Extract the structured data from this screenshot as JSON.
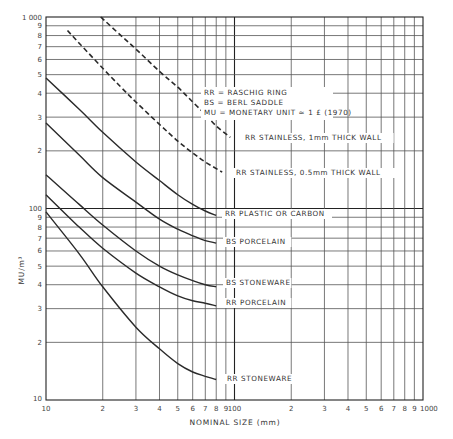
{
  "chart_data": {
    "type": "line",
    "title": "",
    "xlabel": "NOMINAL SIZE (mm)",
    "ylabel": "MU/m³",
    "xscale": "log",
    "yscale": "log",
    "xlim": [
      10,
      1000
    ],
    "ylim": [
      10,
      1000
    ],
    "grid": true,
    "x_tick_labels": [
      {
        "v": 10,
        "t": "10"
      },
      {
        "v": 20,
        "t": "2"
      },
      {
        "v": 30,
        "t": "3"
      },
      {
        "v": 40,
        "t": "4"
      },
      {
        "v": 50,
        "t": "5"
      },
      {
        "v": 60,
        "t": "6"
      },
      {
        "v": 70,
        "t": "7"
      },
      {
        "v": 80,
        "t": "8"
      },
      {
        "v": 90,
        "t": "9"
      },
      {
        "v": 100,
        "t": "100"
      },
      {
        "v": 200,
        "t": "2"
      },
      {
        "v": 300,
        "t": "3"
      },
      {
        "v": 400,
        "t": "4"
      },
      {
        "v": 500,
        "t": "5"
      },
      {
        "v": 600,
        "t": "6"
      },
      {
        "v": 700,
        "t": "7"
      },
      {
        "v": 800,
        "t": "8"
      },
      {
        "v": 900,
        "t": "9"
      },
      {
        "v": 1000,
        "t": "1000"
      }
    ],
    "y_tick_labels": [
      {
        "v": 10,
        "t": "10"
      },
      {
        "v": 20,
        "t": "2"
      },
      {
        "v": 30,
        "t": "3"
      },
      {
        "v": 40,
        "t": "4"
      },
      {
        "v": 50,
        "t": "5"
      },
      {
        "v": 60,
        "t": "6"
      },
      {
        "v": 70,
        "t": "7"
      },
      {
        "v": 80,
        "t": "8"
      },
      {
        "v": 90,
        "t": "9"
      },
      {
        "v": 100,
        "t": "100"
      },
      {
        "v": 200,
        "t": "2"
      },
      {
        "v": 300,
        "t": "3"
      },
      {
        "v": 400,
        "t": "4"
      },
      {
        "v": 500,
        "t": "5"
      },
      {
        "v": 600,
        "t": "6"
      },
      {
        "v": 700,
        "t": "7"
      },
      {
        "v": 800,
        "t": "8"
      },
      {
        "v": 900,
        "t": "9"
      },
      {
        "v": 1000,
        "t": "1 000"
      }
    ],
    "legend_notes": [
      "RR = RASCHIG RING",
      "BS = BERL SADDLE",
      "MU = MONETARY UNIT ≈ 1 £ (1970)"
    ],
    "series": [
      {
        "name": "RR STAINLESS, 1mm THICK WALL",
        "style": "dashed",
        "x": [
          19.5,
          25,
          30,
          40,
          50,
          60,
          70,
          80,
          95
        ],
        "y": [
          1000,
          800,
          680,
          520,
          430,
          360,
          310,
          270,
          235
        ],
        "label_at": [
          245,
          140
        ]
      },
      {
        "name": "RR STAINLESS, 0.5mm THICK WALL",
        "style": "dashed",
        "x": [
          13,
          15,
          20,
          25,
          30,
          40,
          50,
          60,
          70,
          86
        ],
        "y": [
          850,
          730,
          540,
          430,
          360,
          275,
          225,
          195,
          175,
          155
        ],
        "label_at": [
          236,
          175
        ]
      },
      {
        "name": "RR PLASTIC OR CARBON",
        "style": "solid",
        "x": [
          10,
          15,
          20,
          30,
          40,
          50,
          60,
          70,
          80
        ],
        "y": [
          480,
          330,
          250,
          175,
          140,
          118,
          105,
          97,
          92
        ],
        "label_at": [
          225,
          216
        ]
      },
      {
        "name": "BS PORCELAIN",
        "style": "solid",
        "x": [
          10,
          15,
          20,
          30,
          40,
          50,
          60,
          70,
          80
        ],
        "y": [
          280,
          190,
          145,
          108,
          88,
          78,
          72,
          68,
          66
        ],
        "label_at": [
          226,
          244
        ]
      },
      {
        "name": "BS STONEWARE",
        "style": "solid",
        "x": [
          10,
          15,
          20,
          30,
          40,
          50,
          60,
          70,
          80
        ],
        "y": [
          150,
          105,
          82,
          60,
          50,
          45,
          42,
          40,
          39
        ],
        "label_at": [
          226,
          285
        ]
      },
      {
        "name": "RR PORCELAIN",
        "style": "solid",
        "x": [
          10,
          15,
          20,
          30,
          40,
          50,
          60,
          70,
          80
        ],
        "y": [
          118,
          80,
          62,
          46,
          39,
          35,
          33,
          32,
          31
        ],
        "label_at": [
          226,
          305
        ]
      },
      {
        "name": "RR STONEWARE",
        "style": "solid",
        "x": [
          10,
          15,
          20,
          30,
          40,
          50,
          60,
          70,
          80
        ],
        "y": [
          96,
          58,
          39,
          24,
          18.5,
          15.5,
          14,
          13.3,
          12.8
        ],
        "label_at": [
          227,
          381
        ]
      }
    ]
  },
  "labels": {
    "ylabel": "MU/m³",
    "xlabel": "NOMINAL SIZE (mm)"
  }
}
